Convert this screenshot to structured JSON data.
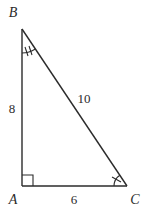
{
  "diagram": {
    "type": "right-triangle",
    "vertices": {
      "A": {
        "label": "A",
        "x": 22,
        "y": 186,
        "label_x": 13,
        "label_y": 200
      },
      "B": {
        "label": "B",
        "x": 22,
        "y": 29,
        "label_x": 13,
        "label_y": 13
      },
      "C": {
        "label": "C",
        "x": 127,
        "y": 186,
        "label_x": 135,
        "label_y": 200
      }
    },
    "sides": {
      "AB": {
        "label": "8",
        "label_x": 12,
        "label_y": 108
      },
      "BC": {
        "label": "10",
        "label_x": 84,
        "label_y": 98
      },
      "AC": {
        "label": "6",
        "label_x": 74,
        "label_y": 199
      }
    },
    "markers": {
      "right_angle_at": "A",
      "angle_B_ticks": 2,
      "angle_C_ticks": 1
    },
    "colors": {
      "stroke": "#2b2b2b",
      "background": "#ffffff"
    }
  }
}
